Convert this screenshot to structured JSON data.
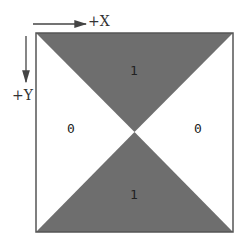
{
  "axes": {
    "x_label": "+X",
    "y_label": "+Y"
  },
  "regions": {
    "top": "1",
    "bottom": "1",
    "left": "0",
    "right": "0"
  },
  "colors": {
    "fill": "#6e6e6e",
    "border": "#555555",
    "background": "#ffffff"
  }
}
